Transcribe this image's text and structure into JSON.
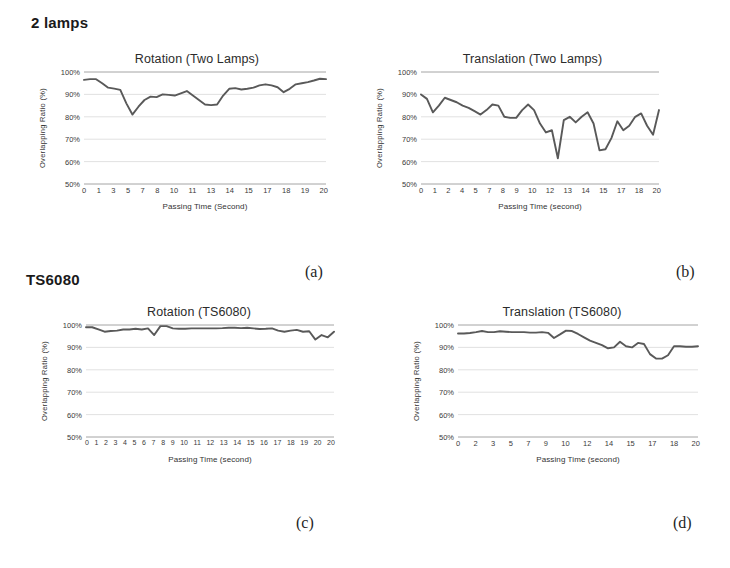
{
  "figure": {
    "row_headings": [
      {
        "id": "lamps",
        "label": "2 lamps"
      },
      {
        "id": "ts6080",
        "label": "TS6080"
      }
    ],
    "captions": {
      "a": "(a)",
      "b": "(b)",
      "c": "(c)",
      "d": "(d)"
    },
    "axis_color": "#9a9a9a",
    "line_color": "#595959",
    "grid_color": "#c8c8c8"
  },
  "chart_data": [
    {
      "id": "a",
      "type": "line",
      "title": "Rotation (Two Lamps)",
      "xlabel": "Passing Time (Second)",
      "ylabel": "Overlapping Ratio (%)",
      "ylim": [
        50,
        100
      ],
      "yticks": [
        "100%",
        "90%",
        "80%",
        "70%",
        "60%",
        "50%"
      ],
      "ytick_values": [
        100,
        90,
        80,
        70,
        60,
        50
      ],
      "grid": true,
      "legend": "none",
      "xticks": [
        "0",
        "1",
        "3",
        "5",
        "7",
        "8",
        "10",
        "11",
        "13",
        "14",
        "15",
        "17",
        "18",
        "19",
        "20"
      ],
      "x": [
        0,
        0.5,
        1,
        1.5,
        2,
        2.5,
        3,
        3.5,
        4,
        4.5,
        5,
        5.5,
        6,
        6.5,
        7,
        7.5,
        8,
        8.5,
        9,
        9.5,
        10,
        10.5,
        11,
        11.5,
        12,
        12.5,
        13,
        13.5,
        14,
        14.5,
        15,
        15.5,
        16,
        16.5,
        17,
        17.5,
        18,
        18.5,
        19,
        19.5,
        20
      ],
      "values": [
        96.5,
        96.8,
        96.8,
        95.0,
        93.0,
        92.6,
        92.0,
        86.0,
        81.0,
        84.5,
        87.5,
        89.0,
        88.8,
        90.0,
        89.8,
        89.5,
        90.5,
        91.5,
        89.5,
        87.5,
        85.5,
        85.2,
        85.5,
        89.5,
        92.5,
        92.8,
        92.2,
        92.5,
        93.0,
        94.0,
        94.5,
        94.0,
        93.2,
        91.0,
        92.5,
        94.5,
        95.0,
        95.5,
        96.2,
        97.0,
        96.8
      ]
    },
    {
      "id": "b",
      "type": "line",
      "title": "Translation (Two Lamps)",
      "xlabel": "Passing Time (second)",
      "ylabel": "Overlapping Ratio (%)",
      "ylim": [
        50,
        100
      ],
      "yticks": [
        "100%",
        "90%",
        "80%",
        "70%",
        "60%",
        "50%"
      ],
      "ytick_values": [
        100,
        90,
        80,
        70,
        60,
        50
      ],
      "grid": true,
      "legend": "none",
      "xticks": [
        "0",
        "1",
        "2",
        "4",
        "5",
        "7",
        "8",
        "9",
        "10",
        "12",
        "13",
        "14",
        "15",
        "17",
        "18",
        "20"
      ],
      "x": [
        0,
        0.5,
        1,
        1.5,
        2,
        2.5,
        3,
        3.5,
        4,
        4.5,
        5,
        5.5,
        6,
        6.5,
        7,
        7.5,
        8,
        8.5,
        9,
        9.5,
        10,
        10.5,
        11,
        11.5,
        12,
        12.5,
        13,
        13.5,
        14,
        14.5,
        15,
        15.5,
        16,
        16.5,
        17,
        17.5,
        18,
        18.5,
        19,
        19.5,
        20
      ],
      "values": [
        90.0,
        88.0,
        82.0,
        85.0,
        88.5,
        87.5,
        86.5,
        85.0,
        84.0,
        82.5,
        81.0,
        83.0,
        85.5,
        85.0,
        80.0,
        79.5,
        79.5,
        83.0,
        85.5,
        83.0,
        77.0,
        73.0,
        74.0,
        61.5,
        78.5,
        80.0,
        77.5,
        80.0,
        82.0,
        77.0,
        65.0,
        65.5,
        70.5,
        78.0,
        74.0,
        76.0,
        80.0,
        81.5,
        76.0,
        72.0,
        83.0
      ]
    },
    {
      "id": "c",
      "type": "line",
      "title": "Rotation (TS6080)",
      "xlabel": "Passing Time (second)",
      "ylabel": "Overlapping Ratio (%)",
      "ylim": [
        50,
        100
      ],
      "yticks": [
        "100%",
        "90%",
        "80%",
        "70%",
        "60%",
        "50%"
      ],
      "ytick_values": [
        100,
        90,
        80,
        70,
        60,
        50
      ],
      "grid": true,
      "legend": "none",
      "xticks": [
        "0",
        "1",
        "2",
        "3",
        "4",
        "5",
        "6",
        "7",
        "8",
        "9",
        "10",
        "11",
        "12",
        "13",
        "14",
        "15",
        "16",
        "17",
        "18",
        "19",
        "20",
        "20"
      ],
      "x": [
        0,
        0.5,
        1,
        1.5,
        2,
        2.5,
        3,
        3.5,
        4,
        4.5,
        5,
        5.5,
        6,
        6.5,
        7,
        7.5,
        8,
        8.5,
        9,
        9.5,
        10,
        10.5,
        11,
        11.5,
        12,
        12.5,
        13,
        13.5,
        14,
        14.5,
        15,
        15.5,
        16,
        16.5,
        17,
        17.5,
        18,
        18.5,
        19,
        19.5,
        20
      ],
      "values": [
        99.0,
        99.0,
        98.0,
        97.0,
        97.3,
        97.5,
        98.0,
        98.0,
        98.3,
        98.0,
        98.5,
        95.5,
        99.5,
        99.5,
        98.5,
        98.3,
        98.3,
        98.5,
        98.5,
        98.5,
        98.5,
        98.5,
        98.6,
        98.8,
        98.8,
        98.6,
        98.8,
        98.5,
        98.2,
        98.3,
        98.5,
        97.5,
        97.0,
        97.5,
        97.8,
        97.0,
        97.2,
        93.5,
        95.5,
        94.5,
        97.0
      ]
    },
    {
      "id": "d",
      "type": "line",
      "title": "Translation (TS6080)",
      "xlabel": "Passing Time (second)",
      "ylabel": "Overlapping Ratio (%)",
      "ylim": [
        50,
        100
      ],
      "yticks": [
        "100%",
        "90%",
        "80%",
        "70%",
        "60%",
        "50%"
      ],
      "ytick_values": [
        100,
        90,
        80,
        70,
        60,
        50
      ],
      "grid": true,
      "legend": "none",
      "xticks": [
        "0",
        "2",
        "3",
        "5",
        "7",
        "9",
        "10",
        "12",
        "14",
        "15",
        "17",
        "18",
        "20"
      ],
      "x": [
        0,
        0.5,
        1,
        1.5,
        2,
        2.5,
        3,
        3.5,
        4,
        4.5,
        5,
        5.5,
        6,
        6.5,
        7,
        7.5,
        8,
        8.5,
        9,
        9.5,
        10,
        10.5,
        11,
        11.5,
        12,
        12.5,
        13,
        13.5,
        14,
        14.5,
        15,
        15.5,
        16,
        16.5,
        17,
        17.5,
        18,
        18.5,
        19,
        19.5,
        20
      ],
      "values": [
        96.2,
        96.2,
        96.4,
        96.8,
        97.3,
        96.8,
        96.8,
        97.2,
        97.0,
        96.8,
        96.8,
        96.8,
        96.6,
        96.6,
        96.8,
        96.5,
        94.2,
        95.8,
        97.5,
        97.3,
        96.0,
        94.5,
        93.0,
        92.0,
        91.0,
        89.6,
        90.0,
        92.5,
        90.5,
        90.0,
        92.0,
        91.5,
        87.0,
        85.0,
        85.0,
        86.5,
        90.5,
        90.5,
        90.3,
        90.3,
        90.5
      ]
    }
  ]
}
